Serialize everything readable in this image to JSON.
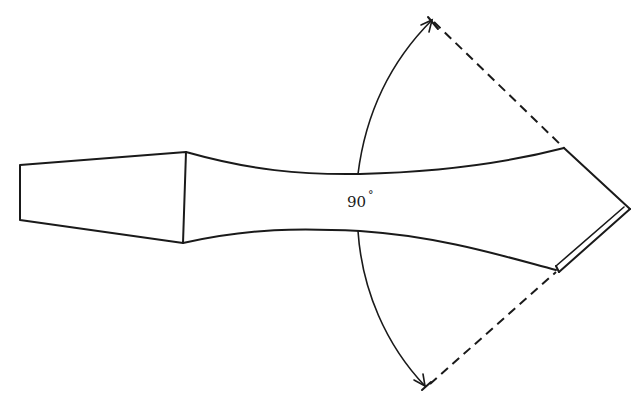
{
  "diagram": {
    "angle_label": "90",
    "degree_symbol": "°",
    "colors": {
      "line": "#1a1a1a",
      "background": "#ffffff"
    },
    "parts": [
      {
        "name": "shank-block",
        "label": ""
      },
      {
        "name": "tapered-neck",
        "label": ""
      },
      {
        "name": "pointed-tip",
        "label": ""
      },
      {
        "name": "angle-arc-upper",
        "label": ""
      },
      {
        "name": "angle-arc-lower",
        "label": ""
      },
      {
        "name": "dashed-extension-upper",
        "label": ""
      },
      {
        "name": "dashed-extension-lower",
        "label": ""
      }
    ]
  }
}
